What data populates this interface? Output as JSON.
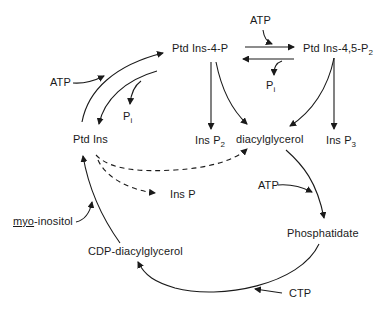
{
  "nodes": {
    "ptdins": "Ptd Ins",
    "ptdins4p": "Ptd Ins-4-P",
    "ptdins45p2_base": "Ptd Ins-4,5-P",
    "ptdins45p2_sub": "2",
    "insp2_base": "Ins P",
    "insp2_sub": "2",
    "diacylglycerol": "diacylglycerol",
    "insp3_base": "Ins P",
    "insp3_sub": "3",
    "insp": "Ins P",
    "phosphatidate": "Phosphatidate",
    "cdp_diacylglycerol": "CDP-diacylglycerol",
    "myo_prefix": "myo",
    "myo_suffix": "-inositol"
  },
  "cofactors": {
    "atp_top": "ATP",
    "atp_left": "ATP",
    "atp_right": "ATP",
    "pi_left_base": "P",
    "pi_left_sub": "i",
    "pi_top_base": "P",
    "pi_top_sub": "i",
    "ctp": "CTP"
  },
  "style": {
    "line_color": "#1a1a1a",
    "background": "#ffffff"
  }
}
